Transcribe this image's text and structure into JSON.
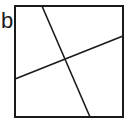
{
  "panel_label": "b",
  "diagram": {
    "shape": "square",
    "stroke_color": "#1a1a1a",
    "square": {
      "x": 15,
      "y": 6,
      "width": 108,
      "height": 111
    },
    "lines": [
      {
        "name": "steep-line",
        "x1": 42,
        "y1": 6,
        "x2": 90,
        "y2": 117
      },
      {
        "name": "shallow-line",
        "x1": 15,
        "y1": 79,
        "x2": 123,
        "y2": 36
      }
    ]
  }
}
